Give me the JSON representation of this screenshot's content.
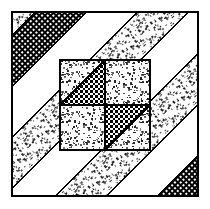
{
  "figure": {
    "title": "Diagonal Stripe Quilt Block",
    "width": 210,
    "height": 209
  },
  "canvas": {
    "background": "#ffffff",
    "ink": "#000000"
  },
  "frame": {
    "name": "outer-border",
    "x": 12,
    "y": 12,
    "width": 186,
    "height": 184,
    "stroke": "#000000",
    "stroke_width": 1.6,
    "fill": "none"
  },
  "textures": {
    "stipple": {
      "label": "stipple",
      "density": 0.34,
      "dot_color": "#1a1a1a",
      "background": "#ffffff",
      "cell": 4
    },
    "crosshatch": {
      "label": "crosshatch",
      "line_color": "#000000",
      "background": "#ffffff",
      "cell": 4,
      "line_width": 1.5
    },
    "checker": {
      "label": "checker-dots",
      "dot_color": "#000000",
      "background": "#ffffff",
      "cell": 5,
      "dot_size": 2.6
    },
    "blank": {
      "label": "white",
      "background": "#ffffff"
    }
  },
  "diagonal_bands": {
    "angle_degrees": 45,
    "direction": "top-left-to-bottom-right",
    "band_width": 36,
    "sequence": [
      {
        "index": 0,
        "texture": "stipple",
        "offset": -150
      },
      {
        "index": 1,
        "texture": "crosshatch",
        "offset": -114
      },
      {
        "index": 2,
        "texture": "blank",
        "offset": -78
      },
      {
        "index": 3,
        "texture": "stipple",
        "offset": -42
      },
      {
        "index": 4,
        "texture": "blank",
        "offset": -6
      },
      {
        "index": 5,
        "texture": "stipple",
        "offset": 30
      },
      {
        "index": 6,
        "texture": "blank",
        "offset": 66
      },
      {
        "index": 7,
        "texture": "crosshatch",
        "offset": 102
      },
      {
        "index": 8,
        "texture": "stipple",
        "offset": 138
      },
      {
        "index": 9,
        "texture": "blank",
        "offset": 174
      }
    ]
  },
  "center_block": {
    "name": "four-patch",
    "x": 60,
    "y": 60,
    "width": 90,
    "height": 90,
    "stroke": "#000000",
    "stroke_width": 1.6,
    "cells": [
      {
        "position": "top-left",
        "x": 60,
        "y": 60,
        "width": 45,
        "height": 45,
        "base_texture": "stipple",
        "triangle_texture": "checker",
        "triangle_corner": "bottom-right"
      },
      {
        "position": "top-right",
        "x": 105,
        "y": 60,
        "width": 45,
        "height": 45,
        "base_texture": "stipple",
        "triangle_texture": "none",
        "triangle_corner": "none"
      },
      {
        "position": "bottom-left",
        "x": 60,
        "y": 105,
        "width": 45,
        "height": 45,
        "base_texture": "stipple",
        "triangle_texture": "none",
        "triangle_corner": "none"
      },
      {
        "position": "bottom-right",
        "x": 105,
        "y": 105,
        "width": 45,
        "height": 45,
        "base_texture": "stipple",
        "triangle_texture": "checker",
        "triangle_corner": "top-left"
      }
    ]
  }
}
